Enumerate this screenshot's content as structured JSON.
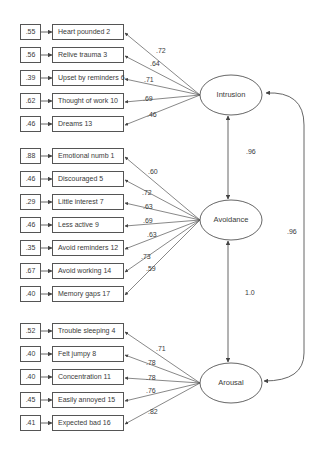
{
  "factors": [
    {
      "name": "Intrusion",
      "center": [
        231,
        95
      ],
      "items": [
        {
          "label": "Heart pounded 2",
          "error": ".55",
          "loading": ".72",
          "y": 32,
          "lx": 156,
          "ly": 51
        },
        {
          "label": "Relive trauma 3",
          "error": ".56",
          "loading": ".64",
          "y": 55,
          "lx": 150,
          "ly": 64
        },
        {
          "label": "Upset by reminders 6",
          "error": ".39",
          "loading": ".71",
          "y": 78,
          "lx": 144,
          "ly": 80
        },
        {
          "label": "Thought of work 10",
          "error": ".62",
          "loading": ".69",
          "y": 101,
          "lx": 143,
          "ly": 99
        },
        {
          "label": "Dreams 13",
          "error": ".46",
          "loading": ".46",
          "y": 124,
          "lx": 147,
          "ly": 115
        }
      ]
    },
    {
      "name": "Avoidance",
      "center": [
        231,
        220
      ],
      "items": [
        {
          "label": "Emotional numb 1",
          "error": ".88",
          "loading": ".60",
          "y": 156,
          "lx": 148,
          "ly": 172
        },
        {
          "label": "Discouraged 5",
          "error": ".46",
          "loading": ".72",
          "y": 179,
          "lx": 142,
          "ly": 193
        },
        {
          "label": "Little interest 7",
          "error": ".29",
          "loading": ".63",
          "y": 202,
          "lx": 143,
          "ly": 207
        },
        {
          "label": "Less active 9",
          "error": ".46",
          "loading": ".69",
          "y": 225,
          "lx": 143,
          "ly": 221
        },
        {
          "label": "Avoid reminders 12",
          "error": ".35",
          "loading": ".63",
          "y": 248,
          "lx": 147,
          "ly": 235
        },
        {
          "label": "Avoid working 14",
          "error": ".67",
          "loading": ".73",
          "y": 271,
          "lx": 141,
          "ly": 257
        },
        {
          "label": "Memory gaps 17",
          "error": ".40",
          "loading": ".59",
          "y": 294,
          "lx": 146,
          "ly": 269
        }
      ]
    },
    {
      "name": "Arousal",
      "center": [
        231,
        383
      ],
      "items": [
        {
          "label": "Trouble sleeping 4",
          "error": ".52",
          "loading": ".71",
          "y": 331,
          "lx": 156,
          "ly": 349
        },
        {
          "label": "Felt jumpy 8",
          "error": ".40",
          "loading": ".78",
          "y": 354,
          "lx": 146,
          "ly": 363
        },
        {
          "label": "Concentration 11",
          "error": ".40",
          "loading": ".78",
          "y": 377,
          "lx": 146,
          "ly": 378
        },
        {
          "label": "Easily annoyed 15",
          "error": ".45",
          "loading": ".76",
          "y": 400,
          "lx": 146,
          "ly": 391
        },
        {
          "label": "Expected bad 16",
          "error": ".41",
          "loading": ".82",
          "y": 423,
          "lx": 148,
          "ly": 412
        }
      ]
    }
  ],
  "correlations": [
    {
      "from": "Intrusion",
      "to": "Avoidance",
      "value": ".96",
      "lx": 246,
      "ly": 152
    },
    {
      "from": "Avoidance",
      "to": "Arousal",
      "value": "1.0",
      "lx": 245,
      "ly": 293
    },
    {
      "from": "Intrusion",
      "to": "Arousal",
      "value": ".96",
      "lx": 287,
      "ly": 232
    }
  ],
  "colors": {
    "line": "#555555",
    "text": "#3a3a3a"
  }
}
